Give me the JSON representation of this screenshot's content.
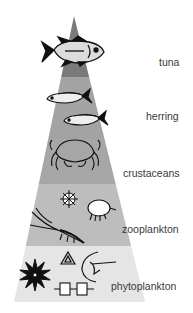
{
  "diagram": {
    "type": "food-pyramid",
    "levels": [
      {
        "id": "tuna",
        "label": "tuna",
        "color": "#7a7a7a"
      },
      {
        "id": "herring",
        "label": "herring",
        "color": "#a3a3a3"
      },
      {
        "id": "crustaceans",
        "label": "crustaceans",
        "color": "#a8a8a8"
      },
      {
        "id": "zooplankton",
        "label": "zooplankton",
        "color": "#bcbcbc"
      },
      {
        "id": "phytoplankton",
        "label": "phytoplankton",
        "color": "#e4e4e4"
      }
    ]
  }
}
